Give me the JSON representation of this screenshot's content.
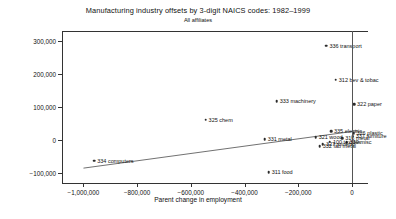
{
  "chart_data": {
    "type": "scatter",
    "title": "Manufacturing industry offsets by 3-digit NAICS codes: 1982–1999",
    "subtitle": "All affiliates",
    "xlabel": "Parent change in employment",
    "ylabel": "Affiliate change in employment",
    "xlim": [
      -1080000,
      60000
    ],
    "ylim": [
      -130000,
      330000
    ],
    "xticks": [
      -1000000,
      -800000,
      -600000,
      -400000,
      -200000,
      0
    ],
    "xticklabels": [
      "−1,000,000",
      "−800,000",
      "−600,000",
      "−400,000",
      "−200,000",
      "0"
    ],
    "yticks": [
      -100000,
      0,
      100000,
      200000,
      300000
    ],
    "yticklabels": [
      "−100,000",
      "0",
      "100,000",
      "200,000",
      "300,000"
    ],
    "grid": false,
    "legend": false,
    "marker_color": "#2b2b2b",
    "fit_line": {
      "x0": -1000000,
      "y0": -85000,
      "x1": 20000,
      "y1": 28000
    },
    "points": [
      {
        "label": "336 transport",
        "x": -95000,
        "y": 285000,
        "side": "right"
      },
      {
        "label": "312 bev & tobac",
        "x": -60000,
        "y": 182000,
        "side": "right"
      },
      {
        "label": "333 machinery",
        "x": -280000,
        "y": 118000,
        "side": "right"
      },
      {
        "label": "322 paper",
        "x": 8000,
        "y": 108000,
        "side": "right"
      },
      {
        "label": "325 chem",
        "x": -545000,
        "y": 62000,
        "side": "right"
      },
      {
        "label": "335 electric",
        "x": -78000,
        "y": 26000,
        "side": "right"
      },
      {
        "label": "326 plastic",
        "x": 6000,
        "y": 21000,
        "side": "right"
      },
      {
        "label": "337 furniture",
        "x": 3000,
        "y": 12000,
        "side": "right"
      },
      {
        "label": "321 wood",
        "x": -135000,
        "y": 8000,
        "side": "right"
      },
      {
        "label": "316 metal",
        "x": -36000,
        "y": 6000,
        "side": "right"
      },
      {
        "label": "331 metal",
        "x": -325000,
        "y": 3000,
        "side": "right"
      },
      {
        "label": "339 misc",
        "x": -20000,
        "y": -6000,
        "side": "right"
      },
      {
        "label": "100 textiles",
        "x": -82000,
        "y": -5000,
        "side": "right"
      },
      {
        "label": "327 mineral",
        "x": -108000,
        "y": -12000,
        "side": "right"
      },
      {
        "label": "332 fab metal",
        "x": -120000,
        "y": -19000,
        "side": "right"
      },
      {
        "label": "311 food",
        "x": -310000,
        "y": -98000,
        "side": "right"
      },
      {
        "label": "334 computers",
        "x": -960000,
        "y": -63000,
        "side": "right"
      }
    ]
  }
}
